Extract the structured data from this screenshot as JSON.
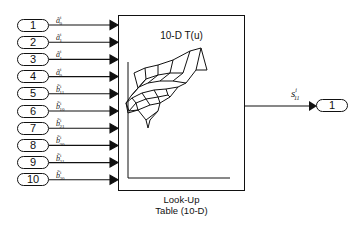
{
  "block": {
    "title": "10-D T(u)",
    "caption_line1": "Look-Up",
    "caption_line2": "Table (10-D)",
    "icon": "3d-surface-plot-icon"
  },
  "inputs": [
    {
      "number": "1",
      "signal": "ã",
      "sub": "0",
      "sup": "i"
    },
    {
      "number": "2",
      "signal": "ã",
      "sub": "1",
      "sup": "i"
    },
    {
      "number": "3",
      "signal": "ã",
      "sub": "1",
      "sup": "i"
    },
    {
      "number": "4",
      "signal": "ã",
      "sub": "0",
      "sup": "i"
    },
    {
      "number": "5",
      "signal": "b̃",
      "sub": "11",
      "sup": "i"
    },
    {
      "number": "6",
      "signal": "b̃",
      "sub": "10",
      "sup": "i"
    },
    {
      "number": "7",
      "signal": "b̃",
      "sub": "21",
      "sup": "i"
    },
    {
      "number": "8",
      "signal": "b̃",
      "sub": "20",
      "sup": "i"
    },
    {
      "number": "9",
      "signal": "b̃",
      "sub": "31",
      "sup": "i"
    },
    {
      "number": "10",
      "signal": "b̃",
      "sub": "30",
      "sup": "i"
    }
  ],
  "output": {
    "number": "1",
    "signal": "s",
    "sub": "11",
    "sup": "i"
  }
}
